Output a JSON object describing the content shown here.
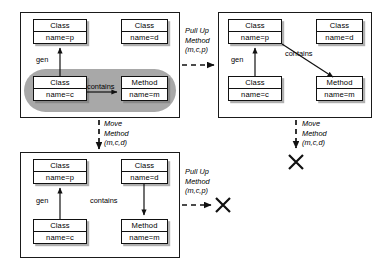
{
  "diagram": {
    "node_labels": {
      "class": "Class",
      "method": "Method",
      "name_p": "name=p",
      "name_d": "name=d",
      "name_c": "name=c",
      "name_m": "name=m"
    },
    "edge_labels": {
      "gen": "gen",
      "contains": "contains"
    },
    "panels": [
      {
        "id": "top-left",
        "nodes": [
          {
            "id": "tl-class-p",
            "header": "Class",
            "body": "name=p"
          },
          {
            "id": "tl-class-d",
            "header": "Class",
            "body": "name=d"
          },
          {
            "id": "tl-class-c",
            "header": "Class",
            "body": "name=c"
          },
          {
            "id": "tl-method-m",
            "header": "Method",
            "body": "name=m"
          }
        ],
        "edges": [
          {
            "id": "tl-gen",
            "label": "gen",
            "from": "tl-class-c",
            "to": "tl-class-p"
          },
          {
            "id": "tl-contains",
            "label": "contains",
            "from": "tl-class-c",
            "to": "tl-method-m"
          }
        ],
        "highlight": "pill around Class name=c and Method name=m"
      },
      {
        "id": "top-right",
        "nodes": [
          {
            "id": "tr-class-p",
            "header": "Class",
            "body": "name=p"
          },
          {
            "id": "tr-class-d",
            "header": "Class",
            "body": "name=d"
          },
          {
            "id": "tr-class-c",
            "header": "Class",
            "body": "name=c"
          },
          {
            "id": "tr-method-m",
            "header": "Method",
            "body": "name=m"
          }
        ],
        "edges": [
          {
            "id": "tr-gen",
            "label": "gen",
            "from": "tr-class-c",
            "to": "tr-class-p"
          },
          {
            "id": "tr-contains",
            "label": "contains",
            "from": "tr-class-p",
            "to": "tr-method-m"
          }
        ],
        "highlight": null
      },
      {
        "id": "bottom-left",
        "nodes": [
          {
            "id": "bl-class-p",
            "header": "Class",
            "body": "name=p"
          },
          {
            "id": "bl-class-d",
            "header": "Class",
            "body": "name=d"
          },
          {
            "id": "bl-class-c",
            "header": "Class",
            "body": "name=c"
          },
          {
            "id": "bl-method-m",
            "header": "Method",
            "body": "name=m"
          }
        ],
        "edges": [
          {
            "id": "bl-gen",
            "label": "gen",
            "from": "bl-class-c",
            "to": "bl-class-p"
          },
          {
            "id": "bl-contains",
            "label": "contains",
            "from": "bl-class-d",
            "to": "bl-method-m"
          }
        ],
        "highlight": null
      }
    ],
    "transitions": [
      {
        "id": "t-pullup-1",
        "line1": "Pull Up",
        "line2": "Method",
        "line3": "(m,c,p)",
        "from": "top-left",
        "to": "top-right",
        "direction": "right",
        "result": "state"
      },
      {
        "id": "t-move-1",
        "line1": "Move",
        "line2": "Method",
        "line3": "(m,c,d)",
        "from": "top-left",
        "to": "bottom-left",
        "direction": "down",
        "result": "state"
      },
      {
        "id": "t-move-2",
        "line1": "Move",
        "line2": "Method",
        "line3": "(m,c,d)",
        "from": "top-right",
        "to": "cross",
        "direction": "down",
        "result": "cross"
      },
      {
        "id": "t-pullup-2",
        "line1": "Pull Up",
        "line2": "Method",
        "line3": "(m,c,p)",
        "from": "bottom-left",
        "to": "cross",
        "direction": "right",
        "result": "cross"
      }
    ],
    "colors": {
      "stroke": "#111111",
      "panel_border": "#1a1a1a",
      "highlight_fill": "#a8a8a8",
      "background": "#ffffff",
      "shadow": "#6e6e6e"
    }
  }
}
